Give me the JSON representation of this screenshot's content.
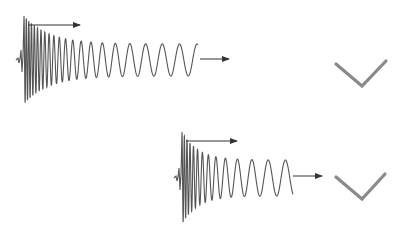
{
  "diagram": {
    "panels": [
      {
        "id": "top",
        "wave": {
          "x0": 24,
          "yc": 60,
          "x_end": 198,
          "start_amp": 44,
          "end_amp": 16,
          "cycles": 13,
          "chirp": true
        },
        "arrow_top": {
          "x1": 28,
          "y": 25,
          "x2": 80
        },
        "arrow_right": {
          "x1": 200,
          "y": 59,
          "x2": 229
        },
        "check": {
          "points": "336,64 362,86 386,61"
        }
      },
      {
        "id": "bottom",
        "wave": {
          "x0": 182,
          "yc": 178,
          "x_end": 293,
          "start_amp": 46,
          "end_amp": 18,
          "cycles": 12,
          "chirp": true
        },
        "arrow_top": {
          "x1": 186,
          "y": 141,
          "x2": 237
        },
        "arrow_right": {
          "x1": 293,
          "y": 176,
          "x2": 322
        },
        "check": {
          "points": "336,177 362,199 385,174"
        }
      }
    ],
    "colors": {
      "wave": "#555555",
      "arrow": "#333333",
      "check": "#8a8a8a"
    }
  }
}
